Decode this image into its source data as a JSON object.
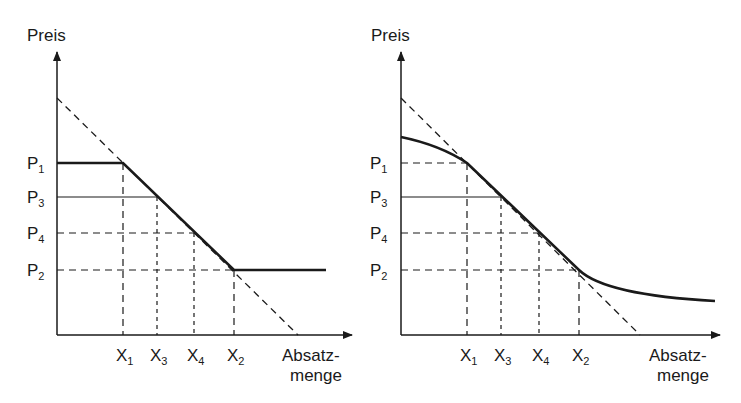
{
  "diagrams": [
    {
      "id": "left",
      "description": "Geknickte Preis-Absatz-Funktion",
      "y_axis_label": "Preis",
      "x_axis_label_line1": "Absatz-",
      "x_axis_label_line2": "menge",
      "price_labels": [
        {
          "base": "P",
          "sub": "1"
        },
        {
          "base": "P",
          "sub": "3"
        },
        {
          "base": "P",
          "sub": "4"
        },
        {
          "base": "P",
          "sub": "2"
        }
      ],
      "quantity_labels": [
        {
          "base": "X",
          "sub": "1"
        },
        {
          "base": "X",
          "sub": "3"
        },
        {
          "base": "X",
          "sub": "4"
        },
        {
          "base": "X",
          "sub": "2"
        }
      ]
    },
    {
      "id": "right",
      "description": "Doppelt geknickte (geglättete) Preis-Absatz-Funktion",
      "y_axis_label": "Preis",
      "x_axis_label_line1": "Absatz-",
      "x_axis_label_line2": "menge",
      "price_labels": [
        {
          "base": "P",
          "sub": "1"
        },
        {
          "base": "P",
          "sub": "3"
        },
        {
          "base": "P",
          "sub": "4"
        },
        {
          "base": "P",
          "sub": "2"
        }
      ],
      "quantity_labels": [
        {
          "base": "X",
          "sub": "1"
        },
        {
          "base": "X",
          "sub": "3"
        },
        {
          "base": "X",
          "sub": "4"
        },
        {
          "base": "X",
          "sub": "2"
        }
      ]
    }
  ],
  "colors": {
    "ink": "#1a1a1a",
    "background": "#ffffff"
  }
}
